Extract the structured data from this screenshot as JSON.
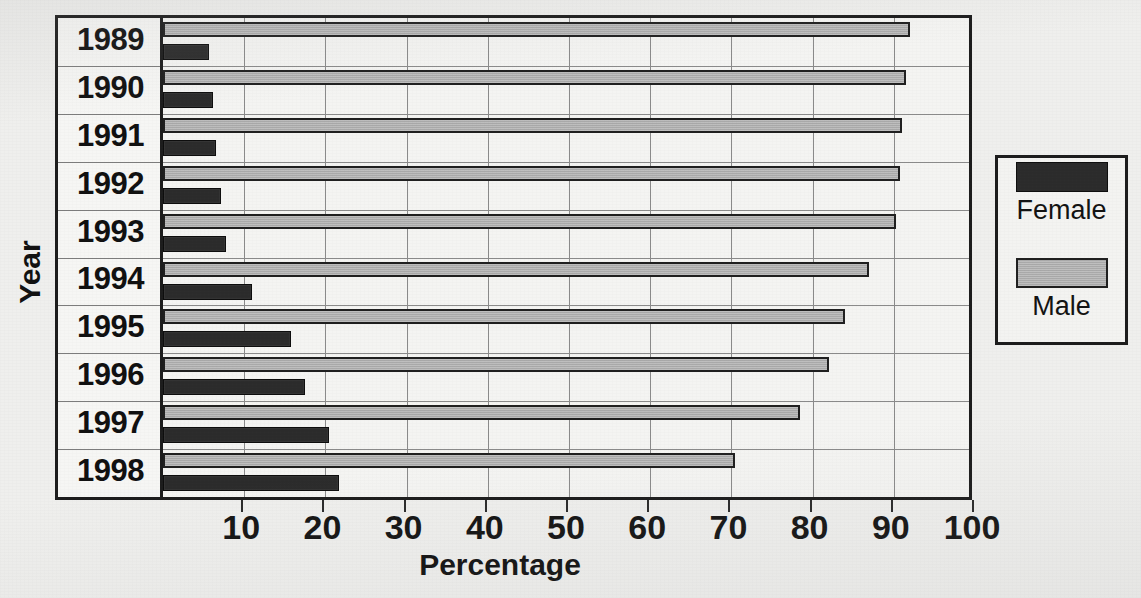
{
  "chart_data": {
    "type": "bar",
    "orientation": "horizontal",
    "title": "Percentage by Year",
    "title_visible": false,
    "xlabel": "Percentage",
    "ylabel": "Year",
    "xlim": [
      0,
      100
    ],
    "xticks": [
      10,
      20,
      30,
      40,
      50,
      60,
      70,
      80,
      90,
      100
    ],
    "xtick_labels": [
      "10",
      "20",
      "30",
      "40",
      "50",
      "60",
      "70",
      "80",
      "90",
      "100"
    ],
    "grid": true,
    "legend_position": "right",
    "categories": [
      "1989",
      "1990",
      "1991",
      "1992",
      "1993",
      "1994",
      "1995",
      "1996",
      "1997",
      "1998"
    ],
    "series": [
      {
        "name": "Male",
        "color": "#a9a9a9",
        "values": [
          92.0,
          91.5,
          91.0,
          90.8,
          90.3,
          87.0,
          84.0,
          82.0,
          78.5,
          70.5
        ]
      },
      {
        "name": "Female",
        "color": "#2b2b2b",
        "values": [
          5.7,
          6.2,
          6.5,
          7.1,
          7.8,
          11.0,
          15.8,
          17.5,
          20.5,
          21.7
        ]
      }
    ]
  },
  "axes": {
    "x_title": "Percentage",
    "y_title": "Year"
  },
  "legend": {
    "entries": [
      {
        "label": "Female",
        "swatch": "dark-swatch"
      },
      {
        "label": "Male",
        "swatch": "gray-swatch"
      }
    ]
  }
}
